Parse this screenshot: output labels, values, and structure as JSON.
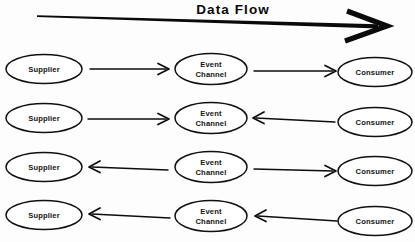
{
  "diagram": {
    "title": "Data  Flow",
    "title_icon": "right-arrow-icon",
    "node_labels": {
      "supplier": "Supplier",
      "event_channel_line1": "Event",
      "event_channel_line2": "Channel",
      "consumer": "Consumer"
    },
    "colors": {
      "stroke": "#101010",
      "fill": "#ffffff",
      "background": "#fdfdfd",
      "text": "#141414"
    },
    "rows": [
      {
        "id": "row-1",
        "model": "push-push",
        "left_arrow_direction": "right",
        "right_arrow_direction": "right",
        "nodes": [
          "Supplier",
          "Event Channel",
          "Consumer"
        ]
      },
      {
        "id": "row-2",
        "model": "push-pull",
        "left_arrow_direction": "right",
        "right_arrow_direction": "left",
        "nodes": [
          "Supplier",
          "Event Channel",
          "Consumer"
        ]
      },
      {
        "id": "row-3",
        "model": "pull-push",
        "left_arrow_direction": "left",
        "right_arrow_direction": "right",
        "nodes": [
          "Supplier",
          "Event Channel",
          "Consumer"
        ]
      },
      {
        "id": "row-4",
        "model": "pull-pull",
        "left_arrow_direction": "left",
        "right_arrow_direction": "left",
        "nodes": [
          "Supplier",
          "Event Channel",
          "Consumer"
        ]
      }
    ]
  }
}
